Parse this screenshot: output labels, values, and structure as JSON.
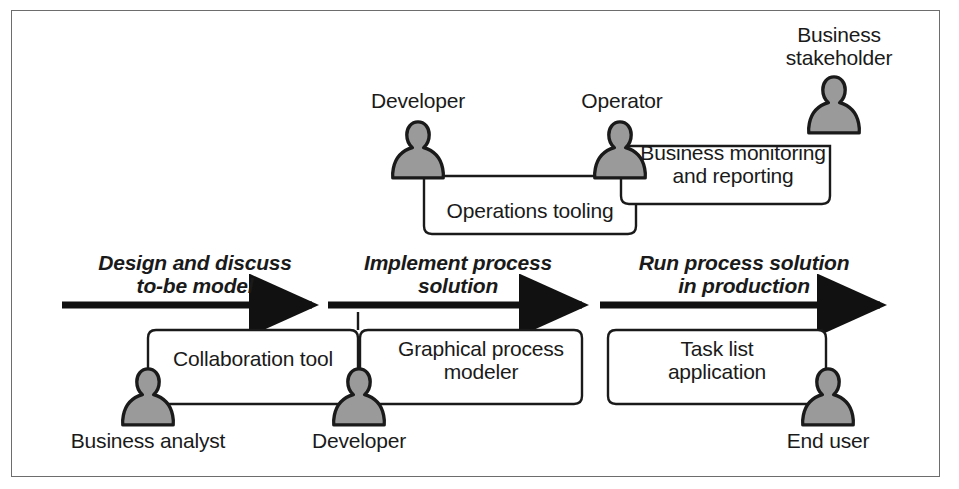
{
  "diagram": {
    "colors": {
      "figure_fill": "#9a9a9a",
      "figure_stroke": "#1a1a1a",
      "line": "#1a1a1a",
      "frame": "#6d6d6d",
      "text": "#1a1a1a",
      "background": "#ffffff"
    },
    "phases": [
      {
        "id": "phase-design",
        "label": "Design and discuss\nto-be model"
      },
      {
        "id": "phase-implement",
        "label": "Implement process\nsolution"
      },
      {
        "id": "phase-run",
        "label": "Run process solution\nin production"
      }
    ],
    "roles": [
      {
        "id": "role-developer-top",
        "label": "Developer",
        "position": "top"
      },
      {
        "id": "role-operator",
        "label": "Operator",
        "position": "top"
      },
      {
        "id": "role-business-stakeholder",
        "label": "Business\nstakeholder",
        "position": "top"
      },
      {
        "id": "role-business-analyst",
        "label": "Business analyst",
        "position": "bottom"
      },
      {
        "id": "role-developer-bottom",
        "label": "Developer",
        "position": "bottom"
      },
      {
        "id": "role-end-user",
        "label": "End user",
        "position": "bottom"
      }
    ],
    "tools": [
      {
        "id": "tool-operations-tooling",
        "label": "Operations tooling",
        "row": "top",
        "connects": [
          "Developer",
          "Operator"
        ]
      },
      {
        "id": "tool-business-monitoring",
        "label": "Business monitoring\nand reporting",
        "row": "top",
        "connects": [
          "Operator",
          "Business stakeholder"
        ]
      },
      {
        "id": "tool-collaboration",
        "label": "Collaboration tool",
        "row": "bottom",
        "connects": [
          "Business analyst",
          "Developer"
        ]
      },
      {
        "id": "tool-graphical-modeler",
        "label": "Graphical process\nmodeler",
        "row": "bottom",
        "connects": [
          "Developer"
        ]
      },
      {
        "id": "tool-task-list",
        "label": "Task list\napplication",
        "row": "bottom",
        "connects": [
          "End user"
        ]
      }
    ]
  }
}
